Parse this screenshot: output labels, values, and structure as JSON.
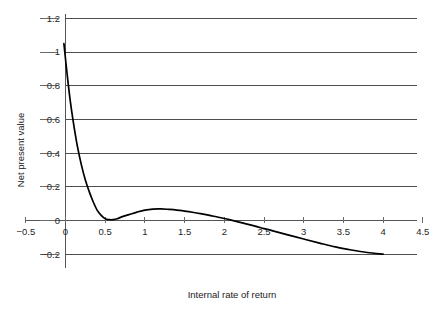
{
  "chart_data": {
    "type": "line",
    "title": "",
    "xlabel": "Internal rate of return",
    "ylabel": "Net present value",
    "xlim": [
      -0.5,
      4.5
    ],
    "ylim": [
      -0.4,
      1.4
    ],
    "grid": true,
    "grid_axis": "y",
    "legend": false,
    "x_ticks": [
      -0.5,
      0,
      0.5,
      1,
      1.5,
      2,
      2.5,
      3,
      3.5,
      4,
      4.5
    ],
    "x_tick_labels": [
      "−0.5",
      "0",
      "0.5",
      "1",
      "1.5",
      "2",
      "2.5",
      "3",
      "3.5",
      "4",
      "4.5"
    ],
    "y_ticks": [
      -0.4,
      -0.2,
      0,
      0.2,
      0.4,
      0.6,
      0.8,
      1,
      1.2,
      1.4
    ],
    "y_tick_labels": [
      "−0.4",
      "−0.2",
      "0",
      "0.2",
      "0.4",
      "0.6",
      "0.8",
      "1",
      "1.2",
      "1.4"
    ],
    "y_tick_labels_visible": [
      "−0.4",
      "−0.2",
      "0",
      "0.2",
      "0.4",
      "0.6",
      "0.8",
      "1",
      "1.2"
    ],
    "series": [
      {
        "name": "Net present value",
        "color": "#000000",
        "x": [
          -0.02,
          0.02,
          0.06,
          0.1,
          0.15,
          0.2,
          0.25,
          0.3,
          0.35,
          0.4,
          0.45,
          0.5,
          0.55,
          0.6,
          0.65,
          0.7,
          0.8,
          0.9,
          1.0,
          1.1,
          1.2,
          1.3,
          1.4,
          1.5,
          1.6,
          1.7,
          1.8,
          1.9,
          2.0,
          2.1,
          2.2,
          2.3,
          2.4,
          2.5,
          2.6,
          2.8,
          3.0,
          3.2,
          3.4,
          3.6,
          3.8,
          4.0
        ],
        "y": [
          1.05,
          0.87,
          0.71,
          0.58,
          0.44,
          0.33,
          0.24,
          0.17,
          0.11,
          0.06,
          0.03,
          0.01,
          0.005,
          0.005,
          0.01,
          0.02,
          0.035,
          0.05,
          0.062,
          0.068,
          0.069,
          0.066,
          0.062,
          0.056,
          0.049,
          0.041,
          0.032,
          0.022,
          0.012,
          0.001,
          -0.011,
          -0.023,
          -0.035,
          -0.048,
          -0.06,
          -0.085,
          -0.11,
          -0.134,
          -0.157,
          -0.175,
          -0.19,
          -0.2
        ]
      }
    ],
    "annotations": [
      {
        "label": "local minimum",
        "x": 0.55,
        "y": 0.005
      },
      {
        "label": "local maximum",
        "x": 1.18,
        "y": 0.069
      },
      {
        "label": "zero crossing",
        "x": 2.32,
        "y": 0.0
      }
    ]
  },
  "axes": {
    "x_axis_name": "Internal rate of return",
    "y_axis_name": "Net present value"
  }
}
